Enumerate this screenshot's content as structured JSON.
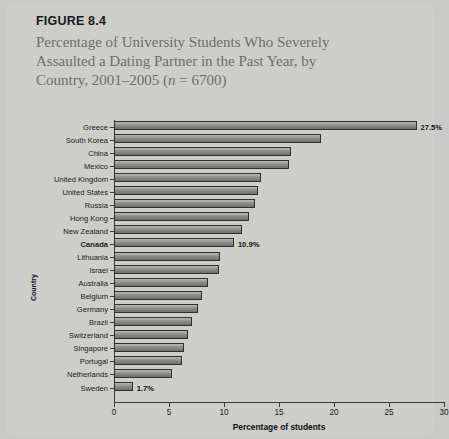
{
  "figure": {
    "number_label": "FIGURE 8.4",
    "title_line1": "Percentage of University Students Who Severely",
    "title_line2": "Assaulted a Dating Partner in the Past Year, by",
    "title_line3_pre": "Country, 2001–2005 (",
    "title_line3_ital": "n",
    "title_line3_post": " = 6700)"
  },
  "chart_data": {
    "type": "bar",
    "orientation": "horizontal",
    "title": "Percentage of University Students Who Severely Assaulted a Dating Partner in the Past Year, by Country, 2001–2005 (n = 6700)",
    "xlabel": "Percentage of students",
    "ylabel": "Country",
    "xlim": [
      0,
      30
    ],
    "xticks": [
      0,
      5,
      10,
      15,
      20,
      25,
      30
    ],
    "xtick_labels": [
      "0",
      "5",
      "10",
      "15",
      "20",
      "25",
      "30"
    ],
    "grid": false,
    "legend": null,
    "categories": [
      "Greece",
      "South Korea",
      "China",
      "Mexico",
      "United Kingdom",
      "United States",
      "Russia",
      "Hong Kong",
      "New Zealand",
      "Canada",
      "Lithuania",
      "Israel",
      "Australia",
      "Belgium",
      "Germany",
      "Brazil",
      "Switzerland",
      "Singapore",
      "Portugal",
      "Netherlands",
      "Sweden"
    ],
    "values": [
      27.5,
      18.8,
      16.1,
      15.9,
      13.4,
      13.1,
      12.8,
      12.3,
      11.6,
      10.9,
      9.6,
      9.5,
      8.5,
      8.0,
      7.6,
      7.1,
      6.7,
      6.4,
      6.2,
      5.3,
      1.7
    ],
    "data_labels": {
      "Greece": "27.5%",
      "Canada": "10.9%",
      "Sweden": "1.7%"
    },
    "highlighted_category": "Canada",
    "colors": {
      "bar_fill": "#8e8e8b",
      "bar_outline": "#2f2f2d",
      "background": "#cdcdca",
      "axis": "#3a3a38",
      "title_text": "#6e6e6c",
      "label_text": "#1b1b1b"
    }
  }
}
